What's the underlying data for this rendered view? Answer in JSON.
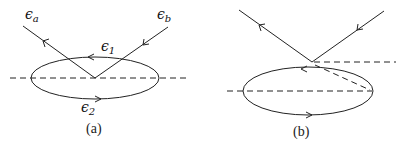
{
  "panels": [
    {
      "id": "a",
      "caption": "(a)",
      "labels": {
        "outgoing": {
          "base": "ϵ",
          "sub": "a"
        },
        "incoming": {
          "base": "ϵ",
          "sub": "b"
        },
        "loop_top": {
          "base": "ϵ",
          "sub": "1"
        },
        "loop_bottom": {
          "base": "ϵ",
          "sub": "2"
        }
      }
    },
    {
      "id": "b",
      "caption": "(b)"
    }
  ],
  "colors": {
    "stroke": "#222222",
    "background": "#ffffff"
  }
}
